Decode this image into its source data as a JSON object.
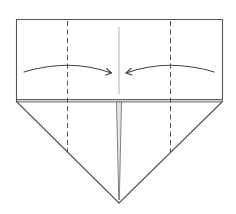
{
  "diagram": {
    "type": "origami-fold-instruction",
    "shapes": {
      "top_rectangle": {
        "x": 16,
        "y": 19,
        "width": 207,
        "height": 80
      },
      "band": {
        "y_top": 99,
        "y_bottom": 102
      },
      "bottom_point": {
        "x": 119,
        "y": 203
      },
      "center_crease_x": 119
    },
    "fold_lines": [
      {
        "kind": "valley",
        "label": "left-valley-fold",
        "x": 67,
        "y_start": 20,
        "y_end": 152
      },
      {
        "kind": "valley",
        "label": "right-valley-fold",
        "x": 170,
        "y_start": 20,
        "y_end": 152
      }
    ],
    "arrows": [
      {
        "label": "fold-left-to-center",
        "direction": "right"
      },
      {
        "label": "fold-right-to-center",
        "direction": "left"
      }
    ],
    "colors": {
      "line": "#555555",
      "crease": "#aaaaaa",
      "band": "#d4d4d4",
      "background": "#ffffff"
    }
  }
}
